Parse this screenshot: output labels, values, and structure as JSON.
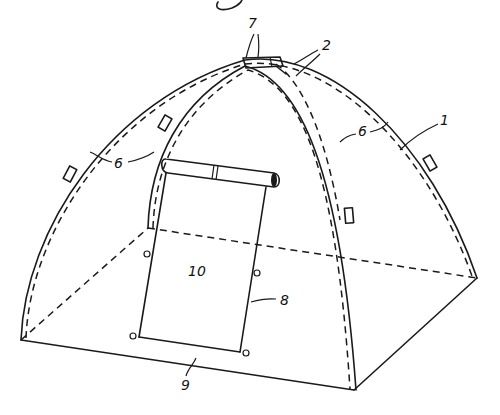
{
  "figure": {
    "figure_label_partial": "g",
    "reference_numerals": [
      {
        "id": "1",
        "text": "1",
        "meaning": "tent body / canopy"
      },
      {
        "id": "2",
        "text": "2",
        "meaning": "pole"
      },
      {
        "id": "6a",
        "text": "6",
        "meaning": "pole sleeve clip (left)"
      },
      {
        "id": "6b",
        "text": "6",
        "meaning": "pole sleeve clip (center)"
      },
      {
        "id": "6c",
        "text": "6",
        "meaning": "pole sleeve clip (right)"
      },
      {
        "id": "7",
        "text": "7",
        "meaning": "apex hub"
      },
      {
        "id": "8",
        "text": "8",
        "meaning": "door opening"
      },
      {
        "id": "9",
        "text": "9",
        "meaning": "floor / base edge"
      },
      {
        "id": "10",
        "text": "10",
        "meaning": "door flap"
      }
    ]
  },
  "colors": {
    "ink": "#1a1a1a",
    "paper": "#ffffff"
  }
}
